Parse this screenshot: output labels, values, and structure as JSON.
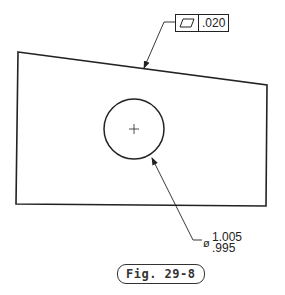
{
  "drawing": {
    "part_outline": [
      [
        18,
        52
      ],
      [
        267,
        85
      ],
      [
        266,
        206
      ],
      [
        16,
        204
      ]
    ],
    "hole": {
      "cx": 134,
      "cy": 129,
      "r": 30
    },
    "line_color": "#222222"
  },
  "feature_control_frame": {
    "symbol": "flatness-icon",
    "tolerance": ".020"
  },
  "hole_dimension": {
    "diameter_symbol": "ø",
    "upper_limit": "1.005",
    "lower_limit": ".995"
  },
  "caption": {
    "label": "Fig. 29-8"
  }
}
